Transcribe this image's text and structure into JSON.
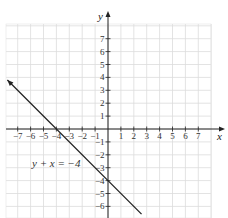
{
  "chart_data": {
    "type": "line",
    "title": "",
    "xlabel": "x",
    "ylabel": "y",
    "xlim": [
      -7,
      7
    ],
    "ylim": [
      -6,
      7
    ],
    "x_ticks": [
      -7,
      -6,
      -5,
      -4,
      -3,
      -2,
      -1,
      1,
      2,
      3,
      4,
      5,
      6,
      7
    ],
    "y_ticks": [
      7,
      6,
      5,
      4,
      3,
      2,
      1,
      -1,
      -2,
      -3,
      -4,
      -5,
      -6
    ],
    "x_tick_labels": [
      "−7",
      "−6",
      "−5",
      "−4",
      "−3",
      "−2",
      "−1",
      "1",
      "2",
      "3",
      "4",
      "5",
      "6",
      "7"
    ],
    "y_tick_labels": [
      "7",
      "6",
      "5",
      "4",
      "3",
      "2",
      "1",
      "−1",
      "−2",
      "−3",
      "−4",
      "−5",
      "−6"
    ],
    "grid": true,
    "series": [
      {
        "name": "y + x = −4",
        "equation": "y + x = -4",
        "slope": -1,
        "intercept": -4,
        "x": [
          -7.8,
          2.6
        ],
        "y": [
          3.8,
          -6.6
        ]
      }
    ],
    "annotations": [
      {
        "text": "y + x = −4",
        "x": -6.2,
        "y": -2.8
      }
    ]
  },
  "labels": {
    "x_axis": "x",
    "y_axis": "y",
    "equation": "y + x = −4"
  }
}
